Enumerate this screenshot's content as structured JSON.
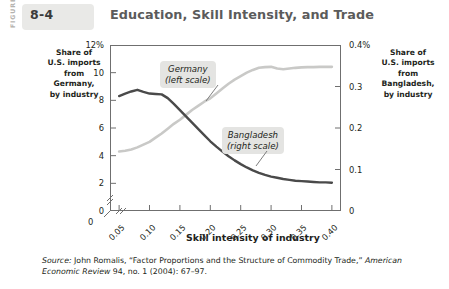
{
  "header": {
    "figure_word": "FIGURE",
    "figure_number": "8-4",
    "title": "Education, Skill Intensity, and Trade"
  },
  "left_axis_caption": "Share of\nU.S. imports\nfrom\nGermany,\nby industry",
  "right_axis_caption": "Share of\nU.S. imports\nfrom\nBangladesh,\nby industry",
  "callouts": {
    "germany": "Germany\n(left scale)",
    "bangladesh": "Bangladesh\n(right scale)"
  },
  "source": {
    "label": "Source:",
    "author": " John Romalis, “Factor Proportions and the Structure of Commodity Trade,” ",
    "journal": "American Economic Review",
    "citation": " 94, no. 1 (2004): 67–97."
  },
  "chart_data": {
    "type": "line",
    "title": "Education, Skill Intensity, and Trade",
    "xlabel": "Skill intensity of industry",
    "ylabel": "Share of U.S. imports from Germany, by industry",
    "y2label": "Share of U.S. imports from Bangladesh, by industry",
    "grid": false,
    "legend_position": "inline-callout",
    "axis_break": true,
    "xlim": [
      0.035,
      0.415
    ],
    "ylim": [
      0,
      12
    ],
    "y2lim": [
      0,
      0.4
    ],
    "xticks": [
      "0.05",
      "0.10",
      "0.15",
      "0.20",
      "0.25",
      "0.30",
      "0.35",
      "0.40"
    ],
    "xtick_values": [
      0.05,
      0.1,
      0.15,
      0.2,
      0.25,
      0.3,
      0.35,
      0.4
    ],
    "x_origin_label": "0",
    "yticks": [
      "2",
      "4",
      "6",
      "8",
      "10",
      "12%"
    ],
    "ytick_values": [
      2,
      4,
      6,
      8,
      10,
      12
    ],
    "y_origin_label": "0",
    "y2ticks": [
      "0.1",
      "0.2",
      "0.3",
      "0.4%"
    ],
    "y2tick_values": [
      0.1,
      0.2,
      0.3,
      0.4
    ],
    "y2_origin_label": "0",
    "x": [
      0.05,
      0.06,
      0.07,
      0.08,
      0.09,
      0.1,
      0.11,
      0.12,
      0.13,
      0.14,
      0.15,
      0.16,
      0.17,
      0.18,
      0.19,
      0.2,
      0.21,
      0.22,
      0.23,
      0.24,
      0.25,
      0.26,
      0.27,
      0.28,
      0.29,
      0.3,
      0.31,
      0.32,
      0.33,
      0.34,
      0.35,
      0.36,
      0.37,
      0.38,
      0.39,
      0.4
    ],
    "series": [
      {
        "name": "Germany (left scale)",
        "axis": "left",
        "color": "#c9c9c7",
        "values": [
          4.3,
          4.35,
          4.45,
          4.6,
          4.8,
          5.0,
          5.3,
          5.6,
          5.95,
          6.3,
          6.6,
          6.95,
          7.3,
          7.6,
          7.9,
          8.15,
          8.5,
          8.85,
          9.2,
          9.5,
          9.75,
          10.0,
          10.2,
          10.35,
          10.4,
          10.42,
          10.3,
          10.25,
          10.3,
          10.35,
          10.38,
          10.4,
          10.4,
          10.42,
          10.42,
          10.42
        ]
      },
      {
        "name": "Bangladesh (right scale)",
        "axis": "right",
        "color": "#4a4a4a",
        "values": [
          0.277,
          0.283,
          0.288,
          0.292,
          0.287,
          0.283,
          0.282,
          0.281,
          0.272,
          0.258,
          0.243,
          0.228,
          0.213,
          0.198,
          0.183,
          0.168,
          0.155,
          0.143,
          0.132,
          0.122,
          0.113,
          0.105,
          0.098,
          0.092,
          0.087,
          0.083,
          0.08,
          0.077,
          0.075,
          0.073,
          0.072,
          0.071,
          0.07,
          0.069,
          0.069,
          0.068
        ]
      }
    ]
  }
}
